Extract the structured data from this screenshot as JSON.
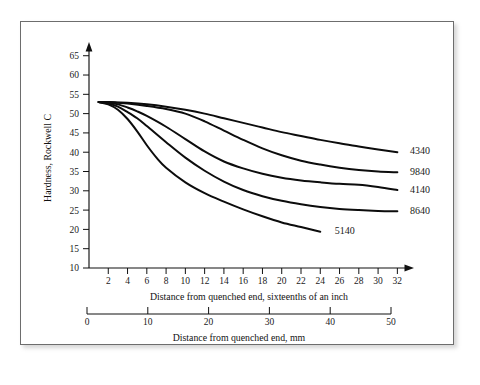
{
  "chart_data": {
    "type": "line",
    "title": "",
    "xlabel": "Distance from quenched end, sixteenths of an inch",
    "xlabel_secondary": "Distance from quenched end, mm",
    "ylabel": "Hardness, Rockwell C",
    "xlim": [
      0,
      33
    ],
    "ylim": [
      10,
      67
    ],
    "xticks": [
      2,
      4,
      6,
      8,
      10,
      12,
      14,
      16,
      18,
      20,
      22,
      24,
      26,
      28,
      30,
      32
    ],
    "yticks": [
      10,
      15,
      20,
      25,
      30,
      35,
      40,
      45,
      50,
      55,
      60,
      65
    ],
    "xticks_mm": [
      0,
      10,
      20,
      30,
      40,
      50
    ],
    "mm_lim": [
      0,
      50
    ],
    "grid": false,
    "legend_position": "right-inline-labels",
    "series": [
      {
        "name": "4340",
        "label": "4340",
        "x": [
          1,
          2,
          3,
          4,
          6,
          8,
          10,
          12,
          14,
          16,
          18,
          20,
          22,
          24,
          26,
          28,
          30,
          32
        ],
        "y": [
          53,
          53,
          52.9,
          52.8,
          52.4,
          51.8,
          51.0,
          50.0,
          48.8,
          47.6,
          46.4,
          45.2,
          44.2,
          43.2,
          42.3,
          41.5,
          40.7,
          40.0
        ],
        "label_x": 33.0,
        "label_y": 40.5
      },
      {
        "name": "9840",
        "label": "9840",
        "x": [
          1,
          2,
          3,
          4,
          6,
          8,
          10,
          12,
          14,
          16,
          18,
          20,
          22,
          24,
          26,
          28,
          30,
          32
        ],
        "y": [
          53,
          53,
          52.8,
          52.6,
          52.0,
          51.2,
          50.0,
          48.0,
          45.6,
          43.2,
          41.0,
          39.2,
          37.8,
          36.8,
          36.0,
          35.4,
          35.0,
          34.8
        ],
        "label_x": 33.0,
        "label_y": 35.0
      },
      {
        "name": "4140",
        "label": "4140",
        "x": [
          1,
          2,
          3,
          4,
          5,
          6,
          8,
          10,
          12,
          14,
          16,
          18,
          20,
          22,
          24,
          26,
          28,
          30,
          32
        ],
        "y": [
          53,
          52.8,
          52.4,
          51.6,
          50.6,
          49.4,
          46.6,
          43.4,
          40.2,
          37.6,
          35.8,
          34.4,
          33.4,
          32.7,
          32.2,
          31.8,
          31.6,
          31.0,
          30.2
        ],
        "label_x": 33.0,
        "label_y": 30.4
      },
      {
        "name": "8640",
        "label": "8640",
        "x": [
          1,
          2,
          3,
          4,
          5,
          6,
          8,
          10,
          12,
          14,
          16,
          18,
          20,
          22,
          24,
          26,
          28,
          30,
          32
        ],
        "y": [
          53,
          52.6,
          51.8,
          50.4,
          48.8,
          46.8,
          42.6,
          38.6,
          35.2,
          32.4,
          30.2,
          28.6,
          27.4,
          26.5,
          25.8,
          25.3,
          25.0,
          24.8,
          24.7
        ],
        "label_x": 33.0,
        "label_y": 24.8
      },
      {
        "name": "5140",
        "label": "5140",
        "x": [
          1,
          2,
          3,
          4,
          5,
          6,
          7,
          8,
          10,
          12,
          14,
          16,
          18,
          20,
          22,
          24
        ],
        "y": [
          53,
          52.4,
          51.0,
          48.6,
          45.4,
          41.8,
          38.6,
          36.0,
          32.2,
          29.4,
          27.2,
          25.2,
          23.4,
          21.8,
          20.6,
          19.4
        ],
        "label_x": 25.2,
        "label_y": 19.8
      }
    ]
  }
}
